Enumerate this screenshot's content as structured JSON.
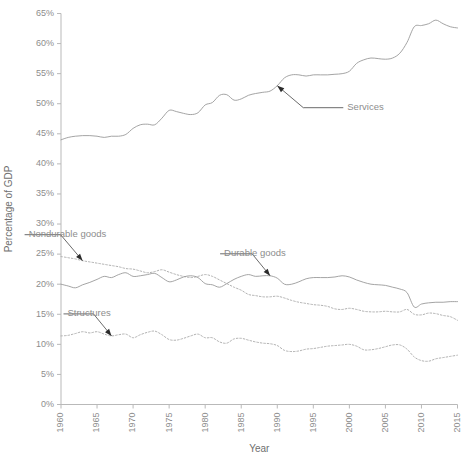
{
  "chart_data": {
    "type": "line",
    "title": "",
    "xlabel": "Year",
    "ylabel": "Percentage of GDP",
    "xlim": [
      1960,
      2015
    ],
    "ylim": [
      0,
      65
    ],
    "grid": false,
    "legend_position": "inline-annotations",
    "x_ticks": [
      "1960",
      "1965",
      "1970",
      "1975",
      "1980",
      "1985",
      "1990",
      "1995",
      "2000",
      "2005",
      "2010",
      "2015"
    ],
    "y_ticks": [
      "0%",
      "5%",
      "10%",
      "15%",
      "20%",
      "25%",
      "30%",
      "35%",
      "40%",
      "45%",
      "50%",
      "55%",
      "60%",
      "65%"
    ],
    "x": [
      1960,
      1961,
      1962,
      1963,
      1964,
      1965,
      1966,
      1967,
      1968,
      1969,
      1970,
      1971,
      1972,
      1973,
      1974,
      1975,
      1976,
      1977,
      1978,
      1979,
      1980,
      1981,
      1982,
      1983,
      1984,
      1985,
      1986,
      1987,
      1988,
      1989,
      1990,
      1991,
      1992,
      1993,
      1994,
      1995,
      1996,
      1997,
      1998,
      1999,
      2000,
      2001,
      2002,
      2003,
      2004,
      2005,
      2006,
      2007,
      2008,
      2009,
      2010,
      2011,
      2012,
      2013,
      2014,
      2015
    ],
    "series": [
      {
        "name": "Services",
        "style": "solid",
        "annotation": "Services",
        "values": [
          44.0,
          44.4,
          44.6,
          44.7,
          44.7,
          44.6,
          44.4,
          44.6,
          44.6,
          44.9,
          45.9,
          46.5,
          46.6,
          46.5,
          47.6,
          48.9,
          48.7,
          48.4,
          48.2,
          48.5,
          49.8,
          50.2,
          51.4,
          51.5,
          50.6,
          50.8,
          51.4,
          51.7,
          51.9,
          52.1,
          53.0,
          54.3,
          54.8,
          54.8,
          54.6,
          54.8,
          54.8,
          54.8,
          54.9,
          55.0,
          55.4,
          56.7,
          57.3,
          57.6,
          57.5,
          57.4,
          57.6,
          58.4,
          60.2,
          62.8,
          63.0,
          63.3,
          63.9,
          63.3,
          62.8,
          62.6
        ]
      },
      {
        "name": "Nondurable goods",
        "style": "dotted",
        "annotation": "Nondurable goods",
        "values": [
          24.6,
          24.4,
          24.2,
          23.9,
          23.7,
          23.5,
          23.3,
          23.1,
          22.9,
          22.6,
          22.5,
          22.2,
          21.9,
          22.1,
          22.4,
          22.0,
          21.6,
          21.3,
          21.1,
          21.3,
          21.6,
          21.3,
          20.7,
          20.1,
          19.5,
          19.0,
          18.3,
          18.1,
          17.9,
          17.9,
          18.0,
          17.7,
          17.3,
          17.0,
          16.8,
          16.6,
          16.5,
          16.3,
          15.9,
          15.8,
          16.0,
          15.8,
          15.5,
          15.4,
          15.4,
          15.5,
          15.4,
          15.4,
          15.8,
          15.0,
          14.9,
          15.2,
          15.1,
          14.8,
          14.6,
          14.0
        ]
      },
      {
        "name": "Durable goods",
        "style": "solid",
        "annotation": "Durable goods",
        "values": [
          20.0,
          19.7,
          19.4,
          19.9,
          20.3,
          20.8,
          21.3,
          21.1,
          21.6,
          21.9,
          21.3,
          21.4,
          21.6,
          21.8,
          21.1,
          20.4,
          20.7,
          21.2,
          21.4,
          21.1,
          20.1,
          19.9,
          19.5,
          20.1,
          20.8,
          21.3,
          21.6,
          21.3,
          21.4,
          21.4,
          21.0,
          20.0,
          20.0,
          20.4,
          20.9,
          21.1,
          21.1,
          21.1,
          21.2,
          21.4,
          21.2,
          20.7,
          20.3,
          20.0,
          19.9,
          19.8,
          19.5,
          19.2,
          18.6,
          16.2,
          16.7,
          16.9,
          17.0,
          17.0,
          17.1,
          17.1
        ]
      },
      {
        "name": "Structures",
        "style": "dotted",
        "annotation": "Structures",
        "values": [
          11.4,
          11.5,
          11.8,
          12.1,
          11.9,
          12.1,
          11.7,
          11.4,
          11.6,
          11.7,
          11.1,
          11.6,
          12.0,
          12.2,
          11.6,
          10.8,
          10.7,
          11.0,
          11.4,
          11.7,
          11.1,
          11.1,
          10.4,
          10.2,
          10.9,
          11.0,
          10.7,
          10.4,
          10.2,
          10.1,
          9.8,
          9.0,
          8.8,
          8.9,
          9.2,
          9.3,
          9.5,
          9.7,
          9.8,
          9.9,
          10.0,
          9.7,
          9.1,
          9.1,
          9.3,
          9.6,
          9.9,
          9.9,
          9.2,
          7.9,
          7.3,
          7.2,
          7.6,
          7.8,
          8.0,
          8.2
        ]
      }
    ],
    "annotations": [
      {
        "label": "Services",
        "series": "Services",
        "at_year": 1990
      },
      {
        "label": "Nondurable goods",
        "series": "Nondurable goods",
        "at_year": 1963
      },
      {
        "label": "Durable goods",
        "series": "Durable goods",
        "at_year": 1989
      },
      {
        "label": "Structures",
        "series": "Structures",
        "at_year": 1967
      }
    ],
    "colors": {
      "line": "#9a9a9a",
      "axis": "#b9b9b9",
      "label": "#8d8d8d",
      "annotation_leader": "#2b2b2b",
      "background": "#ffffff"
    }
  }
}
